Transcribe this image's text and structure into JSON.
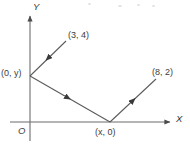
{
  "figure": {
    "background_color": "#ffffff",
    "line_color": "#5a5a5a",
    "text_color": "#3d3d3d",
    "width": 190,
    "height": 146
  },
  "axes": {
    "x_label": "X",
    "y_label": "Y",
    "origin_label": "O",
    "x_axis": {
      "y_px": 122,
      "x_start_px": 10,
      "x_end_px": 172,
      "arrow": "right"
    },
    "y_axis": {
      "x_px": 30,
      "y_start_px": 140,
      "y_end_px": 14,
      "arrow": "up"
    }
  },
  "points": [
    {
      "id": "p34",
      "label": "(3, 4)",
      "x_px": 66,
      "y_px": 41
    },
    {
      "id": "p0y",
      "label": "(0, y)",
      "x_px": 30,
      "y_px": 76
    },
    {
      "id": "px0",
      "label": "(x, 0)",
      "x_px": 110,
      "y_px": 122
    },
    {
      "id": "p82",
      "label": "(8, 2)",
      "x_px": 155,
      "y_px": 80
    }
  ],
  "segments": [
    {
      "id": "seg-incoming",
      "from": "p34",
      "to": "p0y",
      "arrow_direction": "toward-p0y",
      "arrow_at_px": {
        "x": 47,
        "y": 59
      }
    },
    {
      "id": "seg-middle",
      "from": "p0y",
      "to": "px0",
      "arrow_direction": "toward-px0",
      "arrow_at_px": {
        "x": 68,
        "y": 99
      }
    },
    {
      "id": "seg-outgoing",
      "from": "px0",
      "to": "p82",
      "arrow_direction": "toward-p82",
      "arrow_at_px": {
        "x": 133,
        "y": 100
      }
    }
  ]
}
